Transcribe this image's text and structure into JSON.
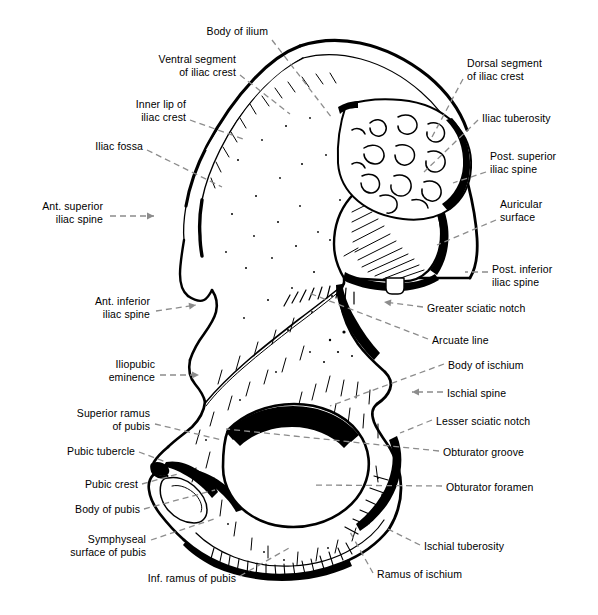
{
  "figure": {
    "width": 598,
    "height": 615,
    "background": "#ffffff",
    "ink_color": "#000000",
    "leader_color": "#8c8c8c"
  },
  "labels": [
    {
      "id": "body-of-ilium",
      "lines": [
        "Body of ilium"
      ],
      "align": "right",
      "x": 268,
      "y": 25,
      "anchor_x": 272,
      "anchor_y": 40,
      "tip_x": 332,
      "tip_y": 118,
      "marker": "none"
    },
    {
      "id": "ventral-segment-iliac-crest",
      "lines": [
        "Ventral segment",
        "of iliac crest"
      ],
      "align": "right",
      "x": 236,
      "y": 53,
      "anchor_x": 240,
      "anchor_y": 75,
      "tip_x": 290,
      "tip_y": 114,
      "marker": "none"
    },
    {
      "id": "inner-lip-of-iliac-crest",
      "lines": [
        "Inner lip of",
        "iliac crest"
      ],
      "align": "right",
      "x": 186,
      "y": 98,
      "anchor_x": 190,
      "anchor_y": 120,
      "tip_x": 246,
      "tip_y": 140,
      "marker": "none"
    },
    {
      "id": "iliac-fossa",
      "lines": [
        "Iliac fossa"
      ],
      "align": "right",
      "x": 143,
      "y": 140,
      "anchor_x": 147,
      "anchor_y": 150,
      "tip_x": 222,
      "tip_y": 187,
      "marker": "none"
    },
    {
      "id": "ant-superior-iliac-spine",
      "lines": [
        "Ant. superior",
        "iliac spine"
      ],
      "align": "right",
      "x": 103,
      "y": 200,
      "anchor_x": 110,
      "anchor_y": 216,
      "tip_x": 154,
      "tip_y": 216,
      "marker": "arrow"
    },
    {
      "id": "ant-inferior-iliac-spine",
      "lines": [
        "Ant. inferior",
        "iliac spine"
      ],
      "align": "right",
      "x": 150,
      "y": 295,
      "anchor_x": 156,
      "anchor_y": 311,
      "tip_x": 196,
      "tip_y": 305,
      "marker": "arrow"
    },
    {
      "id": "iliopubic-eminence",
      "lines": [
        "Iliopubic",
        "eminence"
      ],
      "align": "right",
      "x": 155,
      "y": 358,
      "anchor_x": 160,
      "anchor_y": 375,
      "tip_x": 199,
      "tip_y": 375,
      "marker": "arrow"
    },
    {
      "id": "superior-ramus-of-pubis",
      "lines": [
        "Superior ramus",
        "of pubis"
      ],
      "align": "right",
      "x": 150,
      "y": 407,
      "anchor_x": 155,
      "anchor_y": 424,
      "tip_x": 222,
      "tip_y": 440,
      "marker": "none"
    },
    {
      "id": "pubic-tubercle",
      "lines": [
        "Pubic tubercle"
      ],
      "align": "right",
      "x": 135,
      "y": 445,
      "anchor_x": 139,
      "anchor_y": 452,
      "tip_x": 166,
      "tip_y": 462,
      "marker": "none"
    },
    {
      "id": "pubic-crest",
      "lines": [
        "Pubic crest"
      ],
      "align": "right",
      "x": 138,
      "y": 478,
      "anchor_x": 142,
      "anchor_y": 484,
      "tip_x": 178,
      "tip_y": 474,
      "marker": "none"
    },
    {
      "id": "body-of-pubis",
      "lines": [
        "Body of pubis"
      ],
      "align": "right",
      "x": 140,
      "y": 503,
      "anchor_x": 144,
      "anchor_y": 509,
      "tip_x": 215,
      "tip_y": 490,
      "marker": "none"
    },
    {
      "id": "symphyseal-surface-of-pubis",
      "lines": [
        "Symphyseal",
        "surface of pubis"
      ],
      "align": "right",
      "x": 146,
      "y": 533,
      "anchor_x": 151,
      "anchor_y": 540,
      "tip_x": 214,
      "tip_y": 519,
      "marker": "none"
    },
    {
      "id": "inf-ramus-of-pubis",
      "lines": [
        "Inf. ramus of pubis"
      ],
      "align": "right",
      "x": 236,
      "y": 572,
      "anchor_x": 240,
      "anchor_y": 576,
      "tip_x": 289,
      "tip_y": 548,
      "marker": "none"
    },
    {
      "id": "dorsal-segment-iliac-crest",
      "lines": [
        "Dorsal segment",
        "of iliac crest"
      ],
      "align": "left",
      "x": 467,
      "y": 57,
      "anchor_x": 463,
      "anchor_y": 79,
      "tip_x": 432,
      "tip_y": 137,
      "marker": "none"
    },
    {
      "id": "iliac-tuberosity",
      "lines": [
        "Iliac tuberosity"
      ],
      "align": "left",
      "x": 482,
      "y": 112,
      "anchor_x": 478,
      "anchor_y": 120,
      "tip_x": 424,
      "tip_y": 172,
      "marker": "none"
    },
    {
      "id": "post-superior-iliac-spine",
      "lines": [
        "Post. superior",
        "iliac spine"
      ],
      "align": "left",
      "x": 490,
      "y": 150,
      "anchor_x": 486,
      "anchor_y": 172,
      "tip_x": 453,
      "tip_y": 183,
      "marker": "none"
    },
    {
      "id": "auricular-surface",
      "lines": [
        "Auricular",
        "surface"
      ],
      "align": "left",
      "x": 500,
      "y": 198,
      "anchor_x": 496,
      "anchor_y": 220,
      "tip_x": 437,
      "tip_y": 245,
      "marker": "none"
    },
    {
      "id": "post-inferior-iliac-spine",
      "lines": [
        "Post. inferior",
        "iliac spine"
      ],
      "align": "left",
      "x": 492,
      "y": 263,
      "anchor_x": 488,
      "anchor_y": 272,
      "tip_x": 465,
      "tip_y": 272,
      "marker": "dash"
    },
    {
      "id": "greater-sciatic-notch",
      "lines": [
        "Greater sciatic notch"
      ],
      "align": "left",
      "x": 427,
      "y": 302,
      "anchor_x": 423,
      "anchor_y": 307,
      "tip_x": 384,
      "tip_y": 302,
      "marker": "arrow"
    },
    {
      "id": "arcuate-line",
      "lines": [
        "Arcuate line"
      ],
      "align": "left",
      "x": 432,
      "y": 334,
      "anchor_x": 428,
      "anchor_y": 339,
      "tip_x": 309,
      "tip_y": 293,
      "marker": "none"
    },
    {
      "id": "body-of-ischium",
      "lines": [
        "Body of ischium"
      ],
      "align": "left",
      "x": 448,
      "y": 359,
      "anchor_x": 444,
      "anchor_y": 364,
      "tip_x": 330,
      "tip_y": 406,
      "marker": "none"
    },
    {
      "id": "ischial-spine",
      "lines": [
        "Ischial spine"
      ],
      "align": "left",
      "x": 447,
      "y": 387,
      "anchor_x": 443,
      "anchor_y": 392,
      "tip_x": 412,
      "tip_y": 392,
      "marker": "arrow"
    },
    {
      "id": "lesser-sciatic-notch",
      "lines": [
        "Lesser sciatic notch"
      ],
      "align": "left",
      "x": 436,
      "y": 415,
      "anchor_x": 432,
      "anchor_y": 420,
      "tip_x": 400,
      "tip_y": 433,
      "marker": "none"
    },
    {
      "id": "obturator-groove",
      "lines": [
        "Obturator groove"
      ],
      "align": "left",
      "x": 443,
      "y": 446,
      "anchor_x": 439,
      "anchor_y": 451,
      "tip_x": 226,
      "tip_y": 429,
      "marker": "none"
    },
    {
      "id": "obturator-foramen",
      "lines": [
        "Obturator foramen"
      ],
      "align": "left",
      "x": 446,
      "y": 481,
      "anchor_x": 442,
      "anchor_y": 486,
      "tip_x": 312,
      "tip_y": 485,
      "marker": "none"
    },
    {
      "id": "ischial-tuberosity",
      "lines": [
        "Ischial tuberosity"
      ],
      "align": "left",
      "x": 424,
      "y": 540,
      "anchor_x": 420,
      "anchor_y": 545,
      "tip_x": 388,
      "tip_y": 529,
      "marker": "dash"
    },
    {
      "id": "ramus-of-ischium",
      "lines": [
        "Ramus of ischium"
      ],
      "align": "left",
      "x": 377,
      "y": 568,
      "anchor_x": 373,
      "anchor_y": 573,
      "tip_x": 350,
      "tip_y": 532,
      "marker": "none"
    }
  ]
}
